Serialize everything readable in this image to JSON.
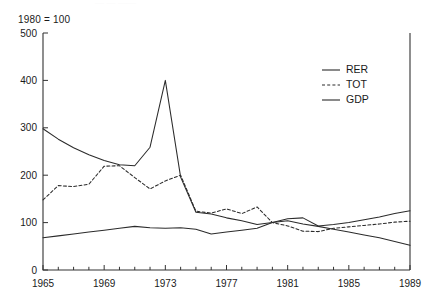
{
  "figure": {
    "index_note": "1980 = 100",
    "ghost_top_text": "— —  ——"
  },
  "legend": {
    "position": "top-right",
    "entries": [
      {
        "label": "RER",
        "style": "solid"
      },
      {
        "label": "TOT",
        "style": "dashed"
      },
      {
        "label": "GDP",
        "style": "solid"
      }
    ]
  },
  "axes": {
    "y_ticks": [
      "0",
      "100",
      "200",
      "300",
      "400",
      "500"
    ],
    "x_ticks_major": [
      "1965",
      "1969",
      "1973",
      "1977",
      "1981",
      "1985",
      "1989"
    ]
  },
  "chart_data": {
    "type": "line",
    "title": "",
    "subtitle": "1980 = 100",
    "xlabel": "",
    "ylabel": "",
    "xlim": [
      1965,
      1989
    ],
    "ylim": [
      0,
      500
    ],
    "yticks": [
      0,
      100,
      200,
      300,
      400,
      500
    ],
    "xticks_major": [
      1965,
      1969,
      1973,
      1977,
      1981,
      1985,
      1989
    ],
    "xticks_minor_step": 1,
    "grid": false,
    "legend_position": "top-right",
    "x": [
      1965,
      1966,
      1967,
      1968,
      1969,
      1970,
      1971,
      1972,
      1973,
      1974,
      1975,
      1976,
      1977,
      1978,
      1979,
      1980,
      1981,
      1982,
      1983,
      1984,
      1985,
      1986,
      1987,
      1988,
      1989
    ],
    "series": [
      {
        "name": "RER",
        "style": "solid",
        "values": [
          298,
          276,
          258,
          243,
          231,
          222,
          220,
          259,
          400,
          196,
          122,
          118,
          110,
          104,
          96,
          100,
          108,
          110,
          93,
          96,
          100,
          106,
          112,
          119,
          125
        ]
      },
      {
        "name": "TOT",
        "style": "dashed",
        "values": [
          148,
          178,
          176,
          181,
          219,
          220,
          195,
          171,
          188,
          200,
          124,
          120,
          129,
          119,
          133,
          100,
          93,
          82,
          81,
          88,
          91,
          94,
          97,
          101,
          103
        ]
      },
      {
        "name": "GDP",
        "style": "solid",
        "values": [
          68,
          72,
          76,
          80,
          84,
          88,
          92,
          89,
          88,
          89,
          86,
          76,
          80,
          84,
          88,
          100,
          104,
          97,
          92,
          86,
          80,
          74,
          68,
          60,
          52
        ]
      }
    ],
    "annotations": [
      {
        "text": "RER peak 400 in 1973",
        "x": 1973,
        "y": 400
      }
    ]
  }
}
